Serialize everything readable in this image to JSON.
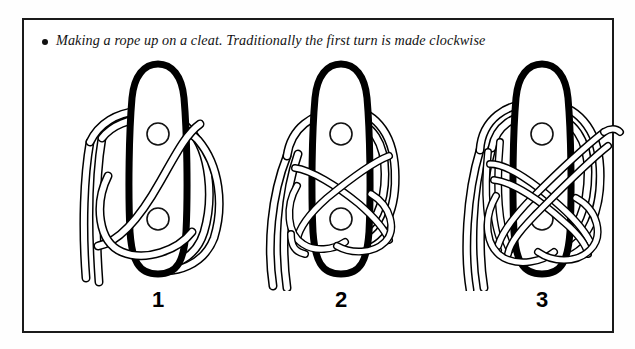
{
  "figure": {
    "caption": {
      "bullet": "bullet-dot",
      "text": "Making a rope up on a cleat. Traditionally the first turn is made clockwise"
    },
    "border_color": "#1a1a1a",
    "background_color": "#ffffff",
    "ink_color": "#000000",
    "panels": [
      {
        "number": "1",
        "name": "cleat-step-one",
        "description": "Rope taken around the base of the cleat with the first turn made clockwise; two standing tails hang down to the left",
        "cleat_holes": 2
      },
      {
        "number": "2",
        "name": "cleat-step-two",
        "description": "A figure-of-eight turn added over the horns of the cleat",
        "cleat_holes": 2
      },
      {
        "number": "3",
        "name": "cleat-step-three",
        "description": "A second figure-of-eight turn completes the make-up on the cleat",
        "cleat_holes": 2
      }
    ]
  }
}
